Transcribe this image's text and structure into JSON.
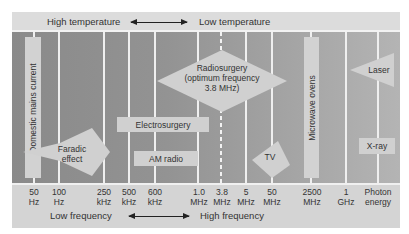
{
  "header": {
    "left_label": "High temperature",
    "right_label": "Low temperature",
    "arrow": "double-arrow-icon"
  },
  "footer": {
    "left_label": "Low frequency",
    "right_label": "High frequency",
    "arrow": "double-arrow-icon"
  },
  "ticks": [
    {
      "value": "50",
      "unit": "Hz"
    },
    {
      "value": "100",
      "unit": "Hz"
    },
    {
      "value": "250",
      "unit": "kHz"
    },
    {
      "value": "500",
      "unit": "kHz"
    },
    {
      "value": "600",
      "unit": "kHz"
    },
    {
      "value": "1.0",
      "unit": "MHz"
    },
    {
      "value": "3.8",
      "unit": "MHz"
    },
    {
      "value": "5",
      "unit": "MHz"
    },
    {
      "value": "50",
      "unit": "MHz"
    },
    {
      "value": "2500",
      "unit": "MHz"
    },
    {
      "value": "1",
      "unit": "GHz"
    },
    {
      "value": "Photon",
      "unit": "energy"
    }
  ],
  "items": {
    "domestic_mains": "Domestic mains current",
    "faradic_line1": "Faradic",
    "faradic_line2": "effect",
    "electrosurgery": "Electrosurgery",
    "am_radio": "AM radio",
    "radiosurgery_line1": "Radiosurgery",
    "radiosurgery_line2": "(optimum frequency",
    "radiosurgery_line3": "3.8 MHz)",
    "tv": "TV",
    "microwave": "Microwave ovens",
    "laser": "Laser",
    "xray": "X-ray"
  },
  "colors": {
    "frame": "#d6d6d6",
    "grid_line": "#efefef",
    "shape_fill": "#d0d0d0",
    "chart_dark": "#8a8a8a",
    "chart_light": "#b4b4b4"
  }
}
